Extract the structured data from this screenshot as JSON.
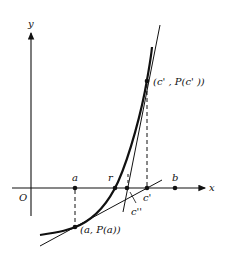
{
  "diagram": {
    "title": "",
    "axes": {
      "x_label": "x",
      "y_label": "y",
      "origin_label": "O"
    },
    "points": {
      "a": "a",
      "r": "r",
      "c_prime": "c'",
      "c_double_prime": "c''",
      "b": "b",
      "pa": "(a, P(a))",
      "pc": "(c' , P(c' ))"
    },
    "colors": {
      "ink": "#111111",
      "background": "#ffffff"
    }
  }
}
